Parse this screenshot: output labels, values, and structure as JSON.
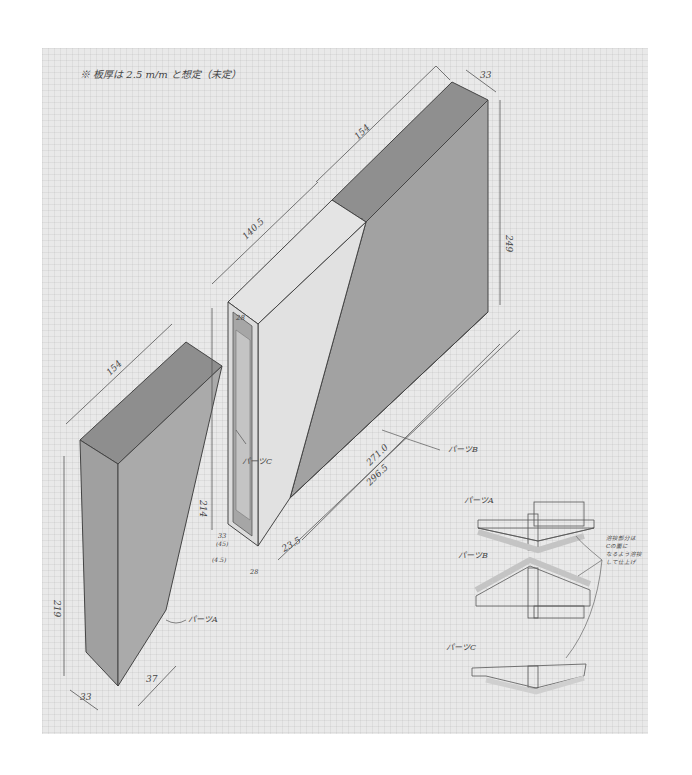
{
  "note": {
    "header": "※ 板厚は 2.5 m/m と想定（未定）"
  },
  "parts": {
    "a": {
      "label": "パーツA"
    },
    "b": {
      "label": "パーツB"
    },
    "c": {
      "label": "パーツC"
    }
  },
  "dimensions": {
    "top_width_b": "154",
    "depth_b": "33",
    "height_b": "249",
    "top_length_c": "140.5",
    "inner_c": "28",
    "height_c": "214",
    "width_a": "154",
    "height_a": "219",
    "base_a_left": "33",
    "base_a_right": "37",
    "bottom_c_a": "33",
    "bottom_c_b": "(45)",
    "bottom_c_c": "(4.5)",
    "bottom_c_d": "28",
    "offset_b": "23.5",
    "length_b_inner": "271.0",
    "length_b_outer": "296.5"
  },
  "sections": {
    "a_label": "パーツA",
    "b_label": "パーツB",
    "c_label": "パーツC",
    "annotation_lines": [
      "溶接部分は",
      "Cの面に",
      "なるよう溶接",
      "して仕上げ"
    ]
  },
  "colors": {
    "paper": "#e9e9e9",
    "shade": "#9a9a9a",
    "shade_dark": "#8a8a8a",
    "line": "#444444",
    "section_fill": "#c9c9c9"
  }
}
